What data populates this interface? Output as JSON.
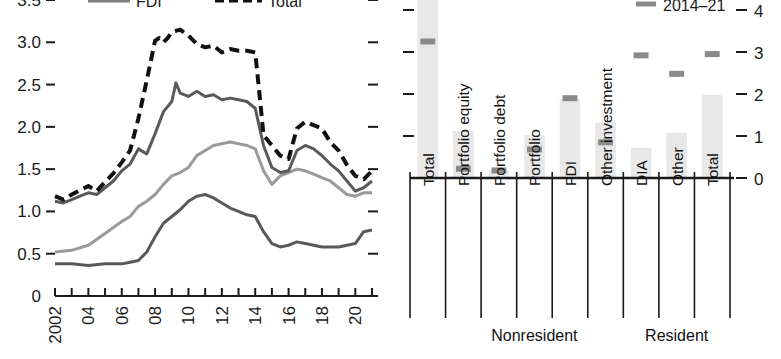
{
  "figure": {
    "background": "#ffffff"
  },
  "chart_data": [
    {
      "type": "line",
      "panel": "left",
      "title": "",
      "xlabel": "",
      "ylabel": "",
      "xlim": [
        2002,
        2021
      ],
      "ylim": [
        0,
        3.5
      ],
      "ytick_labels": [
        "3.5",
        "3.0",
        "2.5",
        "2.0",
        "1.5",
        "1.0",
        "0.5",
        "0"
      ],
      "ytick_values": [
        3.5,
        3.0,
        2.5,
        2.0,
        1.5,
        1.0,
        0.5,
        0
      ],
      "xtick_labels": [
        "2002",
        "04",
        "06",
        "08",
        "10",
        "12",
        "14",
        "16",
        "18",
        "20"
      ],
      "xtick_values": [
        2002,
        2004,
        2006,
        2008,
        2010,
        2012,
        2014,
        2016,
        2018,
        2020
      ],
      "minor_ticks": true,
      "grid": false,
      "right_axis_ticks": [
        3.5,
        3.0,
        2.5,
        2.0,
        1.5,
        1.0,
        0.5
      ],
      "legend": {
        "position": "top",
        "entries": [
          {
            "label": "FDI",
            "color": "#7f7f7f",
            "style": "solid"
          },
          {
            "label": "Total",
            "color": "#111111",
            "style": "dashed"
          }
        ]
      },
      "series": [
        {
          "name": "Total",
          "color": "#111111",
          "style": "dashed",
          "x": [
            2002.0,
            2002.5,
            2003.0,
            2003.5,
            2004.0,
            2004.5,
            2005.0,
            2005.5,
            2006.0,
            2006.5,
            2007.0,
            2007.5,
            2008.0,
            2008.25,
            2008.5,
            2008.75,
            2009.0,
            2009.5,
            2010.0,
            2010.5,
            2011.0,
            2011.5,
            2012.0,
            2012.5,
            2013.0,
            2013.5,
            2014.0,
            2014.25,
            2014.5,
            2015.0,
            2015.5,
            2016.0,
            2016.5,
            2017.0,
            2017.5,
            2018.0,
            2018.5,
            2019.0,
            2019.5,
            2020.0,
            2020.5,
            2021.0
          ],
          "y": [
            1.18,
            1.14,
            1.2,
            1.25,
            1.3,
            1.24,
            1.35,
            1.45,
            1.58,
            1.72,
            2.1,
            2.55,
            3.02,
            3.05,
            3.0,
            3.05,
            3.12,
            3.15,
            3.08,
            2.98,
            2.94,
            2.96,
            2.88,
            2.92,
            2.9,
            2.9,
            2.88,
            2.4,
            1.9,
            1.78,
            1.66,
            1.62,
            1.98,
            2.06,
            2.02,
            1.98,
            1.82,
            1.72,
            1.55,
            1.42,
            1.38,
            1.48
          ]
        },
        {
          "name": "Series 2",
          "color": "#5a5a5a",
          "style": "solid",
          "x": [
            2002.0,
            2002.5,
            2003.0,
            2003.5,
            2004.0,
            2004.5,
            2005.0,
            2005.5,
            2006.0,
            2006.5,
            2007.0,
            2007.5,
            2008.0,
            2008.5,
            2009.0,
            2009.25,
            2009.5,
            2010.0,
            2010.5,
            2011.0,
            2011.5,
            2012.0,
            2012.5,
            2013.0,
            2013.5,
            2014.0,
            2014.5,
            2015.0,
            2015.5,
            2016.0,
            2016.5,
            2017.0,
            2017.5,
            2018.0,
            2018.5,
            2019.0,
            2019.5,
            2020.0,
            2020.5,
            2021.0
          ],
          "y": [
            1.12,
            1.1,
            1.14,
            1.18,
            1.22,
            1.2,
            1.28,
            1.36,
            1.48,
            1.56,
            1.74,
            1.68,
            1.92,
            2.18,
            2.3,
            2.52,
            2.4,
            2.36,
            2.42,
            2.36,
            2.38,
            2.32,
            2.34,
            2.32,
            2.3,
            2.22,
            1.78,
            1.52,
            1.46,
            1.48,
            1.72,
            1.78,
            1.74,
            1.66,
            1.56,
            1.48,
            1.36,
            1.24,
            1.28,
            1.36
          ]
        },
        {
          "name": "Series 3",
          "color": "#9a9a9a",
          "style": "solid",
          "x": [
            2002.0,
            2003.0,
            2004.0,
            2005.0,
            2006.0,
            2006.5,
            2007.0,
            2007.5,
            2008.0,
            2008.5,
            2009.0,
            2009.5,
            2010.0,
            2010.5,
            2011.0,
            2011.5,
            2012.0,
            2012.5,
            2013.0,
            2013.5,
            2014.0,
            2014.5,
            2015.0,
            2015.5,
            2016.0,
            2016.5,
            2017.0,
            2017.5,
            2018.0,
            2018.5,
            2019.0,
            2019.5,
            2020.0,
            2020.5,
            2021.0
          ],
          "y": [
            0.52,
            0.54,
            0.6,
            0.74,
            0.88,
            0.94,
            1.06,
            1.12,
            1.2,
            1.32,
            1.42,
            1.46,
            1.52,
            1.66,
            1.72,
            1.78,
            1.8,
            1.82,
            1.8,
            1.78,
            1.74,
            1.48,
            1.32,
            1.42,
            1.46,
            1.5,
            1.48,
            1.44,
            1.4,
            1.36,
            1.28,
            1.2,
            1.18,
            1.22,
            1.22
          ]
        },
        {
          "name": "FDI",
          "color": "#595959",
          "style": "solid",
          "x": [
            2002.0,
            2003.0,
            2004.0,
            2005.0,
            2006.0,
            2006.5,
            2007.0,
            2007.5,
            2008.0,
            2008.5,
            2009.0,
            2009.5,
            2010.0,
            2010.5,
            2011.0,
            2011.5,
            2012.0,
            2012.5,
            2013.0,
            2013.5,
            2014.0,
            2014.5,
            2015.0,
            2015.5,
            2016.0,
            2016.5,
            2017.0,
            2017.5,
            2018.0,
            2018.5,
            2019.0,
            2019.5,
            2020.0,
            2020.5,
            2021.0
          ],
          "y": [
            0.38,
            0.38,
            0.36,
            0.38,
            0.38,
            0.4,
            0.42,
            0.52,
            0.7,
            0.86,
            0.94,
            1.02,
            1.12,
            1.18,
            1.2,
            1.16,
            1.1,
            1.04,
            1.0,
            0.96,
            0.94,
            0.76,
            0.62,
            0.58,
            0.6,
            0.64,
            0.62,
            0.6,
            0.58,
            0.58,
            0.58,
            0.6,
            0.62,
            0.76,
            0.78
          ]
        }
      ]
    },
    {
      "type": "bar",
      "panel": "right",
      "title": "",
      "xlabel": "",
      "ylabel": "",
      "ylim": [
        0,
        4.4
      ],
      "ytick_labels": [
        "4",
        "3",
        "2",
        "1",
        "0"
      ],
      "ytick_values": [
        4,
        3,
        2,
        1,
        0
      ],
      "left_axis_ticks": [
        4,
        3,
        2,
        1
      ],
      "grid": false,
      "bar_color": "#e8e8e8",
      "marker_color": "#8a8a8a",
      "legend": {
        "position": "top-right",
        "entries": [
          {
            "label": "2014–21",
            "color": "#8a8a8a",
            "style": "marker"
          }
        ]
      },
      "categories": [
        "Total",
        "Portfolio equity",
        "Portfolio debt",
        "Portfolio",
        "FDI",
        "Other investment",
        "DIA",
        "Other",
        "Total"
      ],
      "values": [
        4.45,
        1.12,
        0.18,
        1.02,
        1.88,
        1.32,
        0.72,
        1.08,
        1.98
      ],
      "markers": [
        3.25,
        0.22,
        0.18,
        0.68,
        1.9,
        0.85,
        2.92,
        2.48,
        2.95
      ],
      "marker_series_name": "2014–21",
      "groups": [
        {
          "label": "Nonresident",
          "start": 1,
          "end": 5
        },
        {
          "label": "Resident",
          "start": 6,
          "end": 8
        }
      ]
    }
  ]
}
